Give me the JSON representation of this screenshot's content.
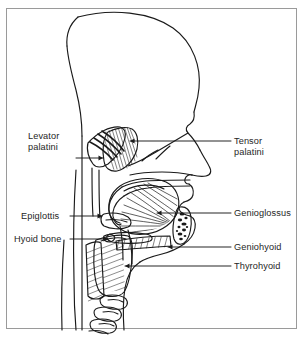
{
  "figure": {
    "type": "anatomical-illustration",
    "view": "midsagittal section of human head and neck",
    "background_color": "#ffffff",
    "border_color": "#9a9a9a",
    "line_color": "#1a1a1a",
    "text_color": "#262626"
  },
  "labels": {
    "left": [
      {
        "id": "levator-palatini",
        "line1": "Levator",
        "line2": "palatini",
        "x": 28,
        "y": 136,
        "leader_from_x": 76,
        "leader_from_y": 158,
        "leader_to_x": 105,
        "leader_to_y": 158,
        "arrow": true
      },
      {
        "id": "epiglottis",
        "line1": "Epiglottis",
        "line2": "",
        "x": 21,
        "y": 211,
        "leader_from_x": 70,
        "leader_from_y": 216,
        "leader_to_x": 104,
        "leader_to_y": 216,
        "arrow": true
      },
      {
        "id": "hyoid-bone",
        "line1": "Hyoid bone",
        "line2": "",
        "x": 14,
        "y": 234,
        "leader_from_x": 70,
        "leader_from_y": 239,
        "leader_to_x": 110,
        "leader_to_y": 239,
        "arrow": true
      }
    ],
    "right": [
      {
        "id": "tensor-palatini",
        "line1": "Tensor",
        "line2": "palatini",
        "x": 234,
        "y": 136,
        "leader_from_x": 231,
        "leader_from_y": 141,
        "leader_to_x": 128,
        "leader_to_y": 141,
        "arrow": true
      },
      {
        "id": "genioglossus",
        "line1": "Genioglossus",
        "line2": "",
        "x": 234,
        "y": 208,
        "leader_from_x": 231,
        "leader_from_y": 213,
        "leader_to_x": 155,
        "leader_to_y": 213,
        "arrow": true
      },
      {
        "id": "geniohyoid",
        "line1": "Geniohyoid",
        "line2": "",
        "x": 234,
        "y": 243,
        "leader_from_x": 231,
        "leader_from_y": 247,
        "leader_to_x": 166,
        "leader_to_y": 247,
        "arrow": true
      },
      {
        "id": "thyrohyoid",
        "line1": "Thyrohyoid",
        "line2": "",
        "x": 234,
        "y": 262,
        "leader_from_x": 231,
        "leader_from_y": 266,
        "leader_to_x": 123,
        "leader_to_y": 266,
        "arrow": true
      }
    ]
  }
}
